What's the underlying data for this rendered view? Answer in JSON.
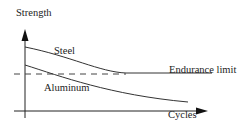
{
  "diagram": {
    "y_axis_label": "Strength",
    "x_axis_label": "Cycles",
    "curves": [
      {
        "name": "Steel",
        "label": "Steel",
        "behavior": "decreases then levels off at endurance limit"
      },
      {
        "name": "Aluminum",
        "label": "Aluminum",
        "behavior": "decreases continuously, no endurance limit"
      }
    ],
    "reference_line": {
      "label": "Endurance limit",
      "style": "dashed"
    }
  }
}
